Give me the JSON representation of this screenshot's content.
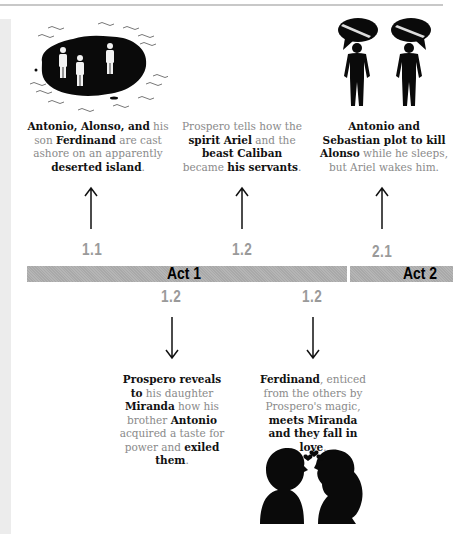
{
  "timeline": {
    "acts": [
      {
        "label": "Act 1"
      },
      {
        "label": "Act 2"
      }
    ],
    "events_above": [
      {
        "scene": "1.1",
        "illustration": "island-castaways-illustration",
        "text_parts": [
          {
            "t": "Antonio, Alonso, and",
            "b": true
          },
          {
            "t": " his son ",
            "b": false
          },
          {
            "t": "Ferdinand",
            "b": true
          },
          {
            "t": " are cast ashore on an apparently ",
            "b": false
          },
          {
            "t": "deserted island",
            "b": true
          },
          {
            "t": ".",
            "b": false
          }
        ]
      },
      {
        "scene": "1.2",
        "illustration": "",
        "text_parts": [
          {
            "t": "Prospero tells how the ",
            "b": false
          },
          {
            "t": "spirit Ariel",
            "b": true
          },
          {
            "t": " and the ",
            "b": false
          },
          {
            "t": "beast Caliban",
            "b": true
          },
          {
            "t": " became ",
            "b": false
          },
          {
            "t": "his servants",
            "b": true
          },
          {
            "t": ".",
            "b": false
          }
        ]
      },
      {
        "scene": "2.1",
        "illustration": "plotters-with-knives-illustration",
        "text_parts": [
          {
            "t": "Antonio and Sebastian plot to kill Alonso",
            "b": true
          },
          {
            "t": " while he sleeps, but Ariel wakes him.",
            "b": false
          }
        ]
      }
    ],
    "events_below": [
      {
        "scene": "1.2",
        "illustration": "",
        "text_parts": [
          {
            "t": "Prospero reveals to",
            "b": true
          },
          {
            "t": " his daughter ",
            "b": false
          },
          {
            "t": "Miranda",
            "b": true
          },
          {
            "t": " how his brother ",
            "b": false
          },
          {
            "t": "Antonio",
            "b": true
          },
          {
            "t": " acquired a taste for power and ",
            "b": false
          },
          {
            "t": "exiled them",
            "b": true
          },
          {
            "t": ".",
            "b": false
          }
        ]
      },
      {
        "scene": "1.2",
        "illustration": "couple-in-love-illustration",
        "text_parts": [
          {
            "t": "Ferdinand",
            "b": true
          },
          {
            "t": ", enticed from the others by Prospero's magic, ",
            "b": false
          },
          {
            "t": "meets Miranda and they fall in love",
            "b": true
          },
          {
            "t": ".",
            "b": false
          }
        ]
      }
    ]
  },
  "colors": {
    "bar": "#b0b0b0",
    "scene_number": "#9a9a9a",
    "body_text": "#8a8a8a",
    "bold_text": "#111111"
  }
}
